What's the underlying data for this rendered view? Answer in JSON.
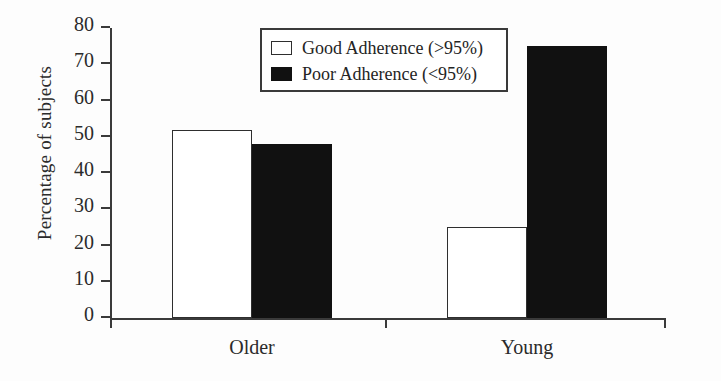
{
  "chart_data": {
    "type": "bar",
    "title": "",
    "xlabel": "",
    "ylabel": "Percentage of subjects",
    "categories": [
      "Older",
      "Young"
    ],
    "series": [
      {
        "name": "Good Adherence (>95%)",
        "values": [
          52,
          25
        ],
        "color": "#ffffff",
        "edge_color": "#2e2e2e"
      },
      {
        "name": "Poor Adherence (<95%)",
        "values": [
          48,
          75
        ],
        "color": "#111111",
        "edge_color": "#111111"
      }
    ],
    "ylim": [
      0,
      80
    ],
    "yticks": [
      0,
      10,
      20,
      30,
      40,
      50,
      60,
      70,
      80
    ],
    "ytick_labels": [
      "0",
      "10",
      "20",
      "30",
      "40",
      "50",
      "60",
      "70",
      "80"
    ],
    "grid": false,
    "legend_position": "upper center",
    "bar_gap_within_group": 0,
    "background_color": "#fdfdfd",
    "axis_color": "#3a3a3a"
  },
  "legend": {
    "entries": [
      {
        "label": "Good Adherence (>95%)",
        "swatch": "open-square-swatch"
      },
      {
        "label": "Poor Adherence (<95%)",
        "swatch": "filled-square-swatch"
      }
    ]
  }
}
